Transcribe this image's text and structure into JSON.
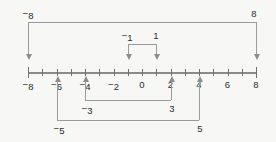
{
  "figure": {
    "type": "number-line-diagram",
    "background_color": "#f7f7f5",
    "line_color": "#8a8a8a",
    "text_color": "#2b2b2b"
  },
  "number_line": {
    "min": -8,
    "max": 8,
    "tick_step": 1,
    "label_step": 2,
    "axis_labels": [
      {
        "value": -8,
        "text": "8",
        "negative": true
      },
      {
        "value": -6,
        "text": "6",
        "negative": true
      },
      {
        "value": -4,
        "text": "4",
        "negative": true
      },
      {
        "value": -2,
        "text": "2",
        "negative": true
      },
      {
        "value": 0,
        "text": "0",
        "negative": false
      },
      {
        "value": 2,
        "text": "2",
        "negative": false
      },
      {
        "value": 4,
        "text": "4",
        "negative": false
      },
      {
        "value": 6,
        "text": "6",
        "negative": false
      },
      {
        "value": 8,
        "text": "8",
        "negative": false
      }
    ]
  },
  "brackets": [
    {
      "id": "pair-8",
      "side": "above",
      "left_value": -8,
      "right_value": 8,
      "left_label": {
        "text": "8",
        "negative": true
      },
      "right_label": {
        "text": "8",
        "negative": false
      },
      "arrow_direction": "down"
    },
    {
      "id": "pair-1",
      "side": "above",
      "left_value": -1,
      "right_value": 1,
      "left_label": {
        "text": "1",
        "negative": true
      },
      "right_label": {
        "text": "1",
        "negative": false
      },
      "arrow_direction": "down"
    },
    {
      "id": "pair-3",
      "side": "below",
      "left_value": -3,
      "right_value": 3,
      "left_label": {
        "text": "3",
        "negative": true
      },
      "right_label": {
        "text": "3",
        "negative": false
      },
      "arrow_direction": "up"
    },
    {
      "id": "pair-5",
      "side": "below",
      "left_value": -5,
      "right_value": 5,
      "left_label": {
        "text": "5",
        "negative": true
      },
      "right_label": {
        "text": "5",
        "negative": false
      },
      "arrow_direction": "up"
    }
  ]
}
